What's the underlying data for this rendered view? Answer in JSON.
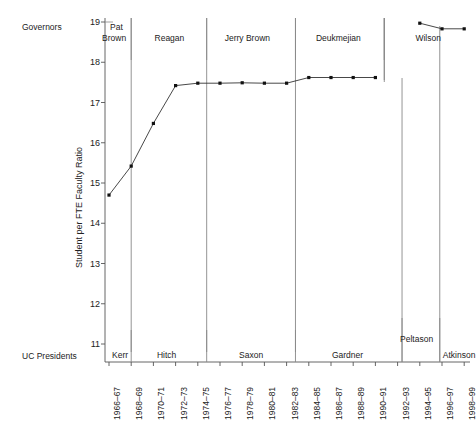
{
  "labels": {
    "governors_row": "Governors",
    "presidents_row": "UC Presidents",
    "y_axis_title": "Student per FTE Faculty Ratio"
  },
  "chart_data": {
    "type": "line",
    "title": "",
    "xlabel": "",
    "ylabel": "Student per FTE Faculty Ratio",
    "ylim": [
      11,
      19
    ],
    "yticks": [
      11,
      12,
      13,
      14,
      15,
      16,
      17,
      18,
      19
    ],
    "ytick_labels": [
      "11",
      "12",
      "13",
      "14",
      "15",
      "16",
      "17",
      "18",
      "19"
    ],
    "grid": false,
    "legend": "none",
    "categories": [
      "1966–67",
      "1968–69",
      "1970–71",
      "1972–73",
      "1974–75",
      "1976–77",
      "1978–79",
      "1980–81",
      "1982–83",
      "1984–85",
      "1986–87",
      "1988–89",
      "1990–91",
      "1992–93",
      "1994–95",
      "1996–97",
      "1998–99"
    ],
    "values": [
      14.7,
      15.42,
      16.48,
      17.42,
      17.48,
      17.48,
      17.49,
      17.48,
      17.48,
      17.62,
      17.62,
      17.62,
      17.62,
      null,
      18.97,
      18.83,
      18.83
    ],
    "marker": "square",
    "line_color": "#333333",
    "marker_color": "#111111"
  },
  "governors": [
    {
      "name": "Pat Brown",
      "start_index": 0,
      "end_index": 1
    },
    {
      "name": "Reagan",
      "start_index": 1,
      "end_index": 4.4
    },
    {
      "name": "Jerry Brown",
      "start_index": 4.4,
      "end_index": 8.4
    },
    {
      "name": "Deukmejian",
      "start_index": 8.4,
      "end_index": 12.4
    },
    {
      "name": "Wilson",
      "start_index": 12.4,
      "end_index": 16.5
    }
  ],
  "presidents": [
    {
      "name": "Kerr",
      "start_index": 0,
      "end_index": 1
    },
    {
      "name": "Hitch",
      "start_index": 1,
      "end_index": 4.4
    },
    {
      "name": "Saxon",
      "start_index": 4.4,
      "end_index": 8.4
    },
    {
      "name": "Gardner",
      "start_index": 8.4,
      "end_index": 13.2
    },
    {
      "name": "Peltason",
      "start_index": 13.2,
      "end_index": 14.9
    },
    {
      "name": "Atkinson",
      "start_index": 14.9,
      "end_index": 16.5
    }
  ],
  "colors": {
    "axis": "#555555",
    "divider": "#888888",
    "text": "#1a1a1a",
    "data_line": "#333333"
  }
}
